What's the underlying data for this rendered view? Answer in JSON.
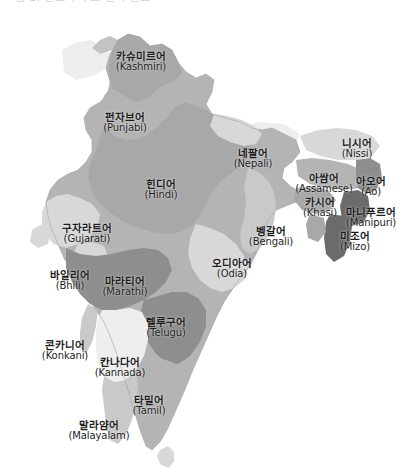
{
  "top_caption": "그림 1. 인도의 주요 언어 분포",
  "figure": {
    "background_color": "#ffffff",
    "outline_color": "#9a9a9a"
  },
  "palette": {
    "very_light": "#eeeeee",
    "light": "#d8d8d8",
    "light_mid": "#c9c9c9",
    "mid": "#b4b4b4",
    "mid_dark": "#a8a8a8",
    "dark": "#8e8e8e",
    "darkest": "#6b6b6b",
    "label_text": "#1d1d1d"
  },
  "labels": [
    {
      "id": "kashmiri",
      "ko": "카슈미르어",
      "en": "(Kashmiri)",
      "x": 141,
      "y": 52,
      "tone": "mid_dark"
    },
    {
      "id": "punjabi",
      "ko": "펀자브어",
      "en": "(Punjabi)",
      "x": 125,
      "y": 113,
      "tone": "mid"
    },
    {
      "id": "hindi",
      "ko": "힌디어",
      "en": "(Hindi)",
      "x": 161,
      "y": 180,
      "tone": "mid_dark"
    },
    {
      "id": "nepali",
      "ko": "네팔어",
      "en": "(Nepali)",
      "x": 253,
      "y": 149,
      "tone": "light"
    },
    {
      "id": "nissi",
      "ko": "니시어",
      "en": "(Nissi)",
      "x": 357,
      "y": 139,
      "tone": "light"
    },
    {
      "id": "assamese",
      "ko": "아쌈어",
      "en": "(Assamese)",
      "x": 324,
      "y": 174,
      "tone": "mid"
    },
    {
      "id": "ao",
      "ko": "아오어",
      "en": "(Ao)",
      "x": 371,
      "y": 177,
      "tone": "dark"
    },
    {
      "id": "khasi",
      "ko": "카시어",
      "en": "(Khasi)",
      "x": 320,
      "y": 198,
      "tone": "mid_dark"
    },
    {
      "id": "manipuri",
      "ko": "마니푸르어",
      "en": "(Manipuri)",
      "x": 371,
      "y": 208,
      "tone": "darkest"
    },
    {
      "id": "mizo",
      "ko": "미조어",
      "en": "(Mizo)",
      "x": 355,
      "y": 232,
      "tone": "darkest"
    },
    {
      "id": "bengali",
      "ko": "벵갈어",
      "en": "(Bengali)",
      "x": 271,
      "y": 227,
      "tone": "light_mid"
    },
    {
      "id": "gujarati",
      "ko": "구자라트어",
      "en": "(Gujarati)",
      "x": 87,
      "y": 224,
      "tone": "light"
    },
    {
      "id": "odia",
      "ko": "오디아어",
      "en": "(Odia)",
      "x": 232,
      "y": 259,
      "tone": "light"
    },
    {
      "id": "bhili",
      "ko": "바일리어",
      "en": "(Bhili)",
      "x": 70,
      "y": 271,
      "tone": "light"
    },
    {
      "id": "marathi",
      "ko": "마라티어",
      "en": "(Marathi)",
      "x": 125,
      "y": 277,
      "tone": "dark"
    },
    {
      "id": "telugu",
      "ko": "텔루구어",
      "en": "(Telugu)",
      "x": 166,
      "y": 318,
      "tone": "dark"
    },
    {
      "id": "konkani",
      "ko": "콘카니어",
      "en": "(Konkani)",
      "x": 65,
      "y": 341,
      "tone": "light_mid"
    },
    {
      "id": "kannada",
      "ko": "칸나다어",
      "en": "(Kannada)",
      "x": 120,
      "y": 358,
      "tone": "very_light"
    },
    {
      "id": "tamil",
      "ko": "타밀어",
      "en": "(Tamil)",
      "x": 149,
      "y": 396,
      "tone": "mid"
    },
    {
      "id": "malayalam",
      "ko": "말라얌어",
      "en": "(Malayalam)",
      "x": 99,
      "y": 421,
      "tone": "light_mid"
    }
  ]
}
